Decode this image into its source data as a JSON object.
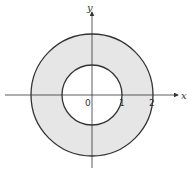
{
  "diagram": {
    "axes": {
      "x_label": "x",
      "y_label": "y"
    },
    "tick_labels": {
      "origin": "0",
      "one": "1",
      "two": "2"
    },
    "inner_radius": 1,
    "outer_radius": 2,
    "fill_color": "#e6e6e6",
    "stroke_color": "#333333"
  }
}
